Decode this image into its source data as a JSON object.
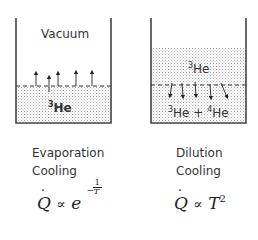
{
  "left_panel": {
    "top_label": "Vacuum",
    "liquid_label_sup": "3",
    "liquid_label": "He",
    "caption_line1": "Evaporation",
    "caption_line2": "Cooling",
    "equation": {
      "lhs": "Q",
      "relation": "∝",
      "base": "e",
      "exponent_sign": "−",
      "exponent_num": "1",
      "exponent_den": "T"
    },
    "arrows": "upward (evaporation)"
  },
  "right_panel": {
    "upper_label_sup": "3",
    "upper_label": "He",
    "lower_label_sup1": "3",
    "lower_label_part1": "He + ",
    "lower_label_sup2": "4",
    "lower_label_part2": "He",
    "caption_line1": "Dilution",
    "caption_line2": "Cooling",
    "equation": {
      "lhs": "Q",
      "relation": "∝",
      "base": "T",
      "exponent": "2"
    },
    "arrows": "downward (dilution)"
  },
  "colors": {
    "wall": "#444444",
    "dots": "#9a9a9a",
    "text": "#333333"
  }
}
